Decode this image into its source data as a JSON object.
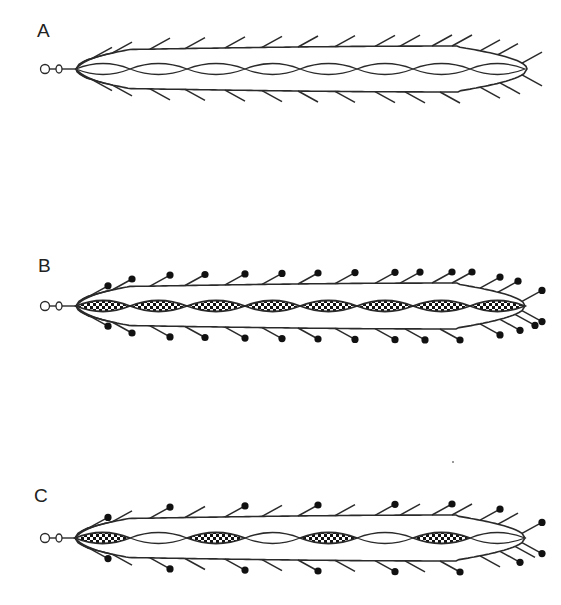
{
  "figure": {
    "stroke_color": "#2a2a2a",
    "dot_color": "#111111",
    "background": "#ffffff",
    "panels": [
      {
        "id": "A",
        "label": "A",
        "label_pos": [
          37,
          22
        ],
        "center_y": 69,
        "apex_x": 76,
        "tip_x": 527,
        "half_height": 23,
        "segments": [
          {
            "from": 76,
            "to": 130,
            "fill": "plain"
          },
          {
            "from": 130,
            "to": 187,
            "fill": "plain"
          },
          {
            "from": 187,
            "to": 245,
            "fill": "plain"
          },
          {
            "from": 245,
            "to": 300,
            "fill": "plain"
          },
          {
            "from": 300,
            "to": 357,
            "fill": "plain"
          },
          {
            "from": 357,
            "to": 413,
            "fill": "plain"
          },
          {
            "from": 413,
            "to": 470,
            "fill": "plain"
          },
          {
            "from": 470,
            "to": 525,
            "fill": "plain"
          }
        ],
        "setae_top": [
          {
            "x": 92,
            "d": false
          },
          {
            "x": 112,
            "d": false
          },
          {
            "x": 150,
            "d": false
          },
          {
            "x": 185,
            "d": false
          },
          {
            "x": 225,
            "d": false
          },
          {
            "x": 262,
            "d": false
          },
          {
            "x": 298,
            "d": false
          },
          {
            "x": 335,
            "d": false
          },
          {
            "x": 375,
            "d": false
          },
          {
            "x": 400,
            "d": false
          },
          {
            "x": 432,
            "d": false
          },
          {
            "x": 452,
            "d": false
          },
          {
            "x": 480,
            "d": false
          },
          {
            "x": 498,
            "d": false
          },
          {
            "x": 522,
            "d": false
          }
        ],
        "setae_bottom": [
          {
            "x": 92,
            "d": false
          },
          {
            "x": 112,
            "d": false
          },
          {
            "x": 150,
            "d": false
          },
          {
            "x": 185,
            "d": false
          },
          {
            "x": 225,
            "d": false
          },
          {
            "x": 262,
            "d": false
          },
          {
            "x": 298,
            "d": false
          },
          {
            "x": 335,
            "d": false
          },
          {
            "x": 375,
            "d": false
          },
          {
            "x": 405,
            "d": false
          },
          {
            "x": 440,
            "d": false
          },
          {
            "x": 480,
            "d": false
          },
          {
            "x": 500,
            "d": false
          },
          {
            "x": 522,
            "d": false
          }
        ]
      },
      {
        "id": "B",
        "label": "B",
        "label_pos": [
          38,
          257
        ],
        "center_y": 306,
        "apex_x": 76,
        "tip_x": 525,
        "half_height": 23,
        "segments": [
          {
            "from": 76,
            "to": 130,
            "fill": "checkered"
          },
          {
            "from": 130,
            "to": 187,
            "fill": "checkered"
          },
          {
            "from": 187,
            "to": 245,
            "fill": "checkered"
          },
          {
            "from": 245,
            "to": 300,
            "fill": "checkered"
          },
          {
            "from": 300,
            "to": 357,
            "fill": "checkered"
          },
          {
            "from": 357,
            "to": 413,
            "fill": "checkered"
          },
          {
            "from": 413,
            "to": 470,
            "fill": "checkered"
          },
          {
            "from": 470,
            "to": 525,
            "fill": "checkered"
          }
        ],
        "setae_top": [
          {
            "x": 88,
            "d": true
          },
          {
            "x": 112,
            "d": true
          },
          {
            "x": 150,
            "d": true
          },
          {
            "x": 185,
            "d": true
          },
          {
            "x": 225,
            "d": true
          },
          {
            "x": 262,
            "d": true
          },
          {
            "x": 298,
            "d": true
          },
          {
            "x": 335,
            "d": true
          },
          {
            "x": 375,
            "d": true
          },
          {
            "x": 400,
            "d": true
          },
          {
            "x": 432,
            "d": true
          },
          {
            "x": 452,
            "d": true
          },
          {
            "x": 480,
            "d": true
          },
          {
            "x": 498,
            "d": true
          },
          {
            "x": 522,
            "d": true
          }
        ],
        "setae_bottom": [
          {
            "x": 88,
            "d": true
          },
          {
            "x": 112,
            "d": true
          },
          {
            "x": 150,
            "d": true
          },
          {
            "x": 185,
            "d": true
          },
          {
            "x": 225,
            "d": true
          },
          {
            "x": 262,
            "d": true
          },
          {
            "x": 298,
            "d": true
          },
          {
            "x": 335,
            "d": true
          },
          {
            "x": 375,
            "d": true
          },
          {
            "x": 405,
            "d": true
          },
          {
            "x": 440,
            "d": true
          },
          {
            "x": 480,
            "d": true
          },
          {
            "x": 500,
            "d": true
          },
          {
            "x": 515,
            "d": true
          },
          {
            "x": 522,
            "d": true
          }
        ]
      },
      {
        "id": "C",
        "label": "C",
        "label_pos": [
          34,
          487
        ],
        "center_y": 538,
        "apex_x": 75,
        "tip_x": 525,
        "half_height": 23,
        "segments": [
          {
            "from": 75,
            "to": 130,
            "fill": "checkered"
          },
          {
            "from": 130,
            "to": 187,
            "fill": "plain"
          },
          {
            "from": 187,
            "to": 245,
            "fill": "checkered"
          },
          {
            "from": 245,
            "to": 300,
            "fill": "plain"
          },
          {
            "from": 300,
            "to": 357,
            "fill": "checkered"
          },
          {
            "from": 357,
            "to": 413,
            "fill": "plain"
          },
          {
            "from": 413,
            "to": 470,
            "fill": "checkered"
          },
          {
            "from": 470,
            "to": 525,
            "fill": "plain"
          }
        ],
        "setae_top": [
          {
            "x": 88,
            "d": true
          },
          {
            "x": 112,
            "d": false
          },
          {
            "x": 150,
            "d": true
          },
          {
            "x": 185,
            "d": false
          },
          {
            "x": 225,
            "d": true
          },
          {
            "x": 262,
            "d": false
          },
          {
            "x": 298,
            "d": true
          },
          {
            "x": 335,
            "d": false
          },
          {
            "x": 375,
            "d": true
          },
          {
            "x": 400,
            "d": false
          },
          {
            "x": 432,
            "d": true
          },
          {
            "x": 452,
            "d": false
          },
          {
            "x": 480,
            "d": true
          },
          {
            "x": 498,
            "d": false
          },
          {
            "x": 522,
            "d": true
          }
        ],
        "setae_bottom": [
          {
            "x": 88,
            "d": true
          },
          {
            "x": 112,
            "d": false
          },
          {
            "x": 150,
            "d": true
          },
          {
            "x": 185,
            "d": false
          },
          {
            "x": 225,
            "d": true
          },
          {
            "x": 262,
            "d": false
          },
          {
            "x": 298,
            "d": true
          },
          {
            "x": 335,
            "d": false
          },
          {
            "x": 375,
            "d": true
          },
          {
            "x": 405,
            "d": false
          },
          {
            "x": 440,
            "d": true
          },
          {
            "x": 480,
            "d": false
          },
          {
            "x": 500,
            "d": true
          },
          {
            "x": 515,
            "d": false
          },
          {
            "x": 522,
            "d": true
          }
        ]
      }
    ]
  }
}
